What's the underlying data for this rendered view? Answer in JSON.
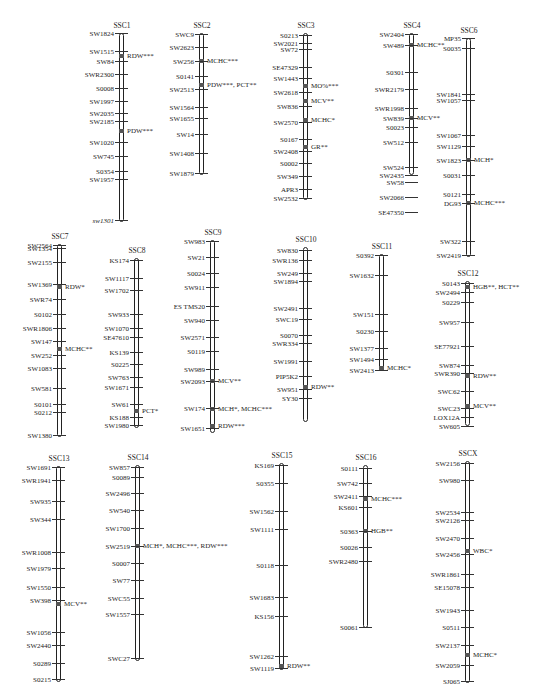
{
  "figure": {
    "chromosomes": [
      {
        "name": "SSC1",
        "x": 120,
        "top": 33,
        "bottom": 221,
        "markers": [
          {
            "label": "SW1824",
            "y": 33
          },
          {
            "label": "SW1515",
            "y": 51
          },
          {
            "label": "SW84",
            "y": 61
          },
          {
            "label": "SWR2300",
            "y": 74
          },
          {
            "label": "S0008",
            "y": 88
          },
          {
            "label": "SW1997",
            "y": 101
          },
          {
            "label": "SW2035",
            "y": 113
          },
          {
            "label": "SW2185",
            "y": 121
          },
          {
            "label": "SW1020",
            "y": 142
          },
          {
            "label": "SW745",
            "y": 156
          },
          {
            "label": "S0354",
            "y": 171
          },
          {
            "label": "SW1957",
            "y": 179
          },
          {
            "label": "sw1301",
            "y": 220
          }
        ],
        "qtls": [
          {
            "label": "RDW***",
            "y": 56
          },
          {
            "label": "PDW***",
            "y": 131
          }
        ]
      },
      {
        "name": "SSC2",
        "x": 200,
        "top": 33,
        "bottom": 174,
        "markers": [
          {
            "label": "SWC9",
            "y": 34
          },
          {
            "label": "SW2623",
            "y": 47
          },
          {
            "label": "SW256",
            "y": 61
          },
          {
            "label": "S0141",
            "y": 76
          },
          {
            "label": "SW2513",
            "y": 89
          },
          {
            "label": "SW1564",
            "y": 107
          },
          {
            "label": "SW1655",
            "y": 118
          },
          {
            "label": "SW14",
            "y": 134
          },
          {
            "label": "SW1408",
            "y": 153
          },
          {
            "label": "SW1879",
            "y": 173
          }
        ],
        "qtls": [
          {
            "label": "MCHC***",
            "y": 61
          },
          {
            "label": "PDW***, PCT**",
            "y": 85
          }
        ]
      },
      {
        "name": "SSC3",
        "x": 304,
        "top": 33,
        "bottom": 199,
        "markers": [
          {
            "label": "S0213",
            "y": 35
          },
          {
            "label": "SW2021",
            "y": 43
          },
          {
            "label": "SW72",
            "y": 49
          },
          {
            "label": "SE47329",
            "y": 67
          },
          {
            "label": "SW1443",
            "y": 78
          },
          {
            "label": "SW2618",
            "y": 92
          },
          {
            "label": "SW836",
            "y": 106
          },
          {
            "label": "SW2570",
            "y": 122
          },
          {
            "label": "S0167",
            "y": 139
          },
          {
            "label": "SW2408",
            "y": 151
          },
          {
            "label": "S0002",
            "y": 163
          },
          {
            "label": "SW349",
            "y": 176
          },
          {
            "label": "APR3",
            "y": 189
          },
          {
            "label": "SW2532",
            "y": 198
          }
        ],
        "qtls": [
          {
            "label": "MO%***",
            "y": 86
          },
          {
            "label": "MCV**",
            "y": 101
          },
          {
            "label": "MCHC*",
            "y": 120
          },
          {
            "label": "GR**",
            "y": 147
          }
        ]
      },
      {
        "name": "SSC4",
        "x": 410,
        "top": 33,
        "bottom": 174,
        "markers": [
          {
            "label": "SW2404",
            "y": 34
          },
          {
            "label": "SW489",
            "y": 45
          },
          {
            "label": "S0301",
            "y": 72
          },
          {
            "label": "SWR2179",
            "y": 89
          },
          {
            "label": "SWR1998",
            "y": 108
          },
          {
            "label": "SW839",
            "y": 118
          },
          {
            "label": "S0023",
            "y": 127
          },
          {
            "label": "SW512",
            "y": 142
          },
          {
            "label": "SW524",
            "y": 167
          },
          {
            "label": "SW2435",
            "y": 175
          },
          {
            "label": "SW58",
            "y": 182
          },
          {
            "label": "SW2066",
            "y": 197
          },
          {
            "label": "SE47350",
            "y": 212
          }
        ],
        "qtls": [
          {
            "label": "MCHC**",
            "y": 45
          },
          {
            "label": "MCV**",
            "y": 118
          }
        ]
      },
      {
        "name": "SSC6",
        "x": 467,
        "top": 38,
        "bottom": 256,
        "markers": [
          {
            "label": "MP35",
            "y": 38
          },
          {
            "label": "S0035",
            "y": 48
          },
          {
            "label": "SW1841",
            "y": 94
          },
          {
            "label": "SW1057",
            "y": 100
          },
          {
            "label": "SW1067",
            "y": 135
          },
          {
            "label": "SW1129",
            "y": 146
          },
          {
            "label": "SW1823",
            "y": 160
          },
          {
            "label": "S0031",
            "y": 175
          },
          {
            "label": "S0121",
            "y": 194
          },
          {
            "label": "DG93",
            "y": 203
          },
          {
            "label": "SW322",
            "y": 241
          },
          {
            "label": "SW2419",
            "y": 255
          }
        ],
        "qtls": [
          {
            "label": "MCH*",
            "y": 160
          },
          {
            "label": "MCHC***",
            "y": 203
          }
        ]
      },
      {
        "name": "SSC7",
        "x": 58,
        "top": 244,
        "bottom": 436,
        "markers": [
          {
            "label": "SW2564",
            "y": 245
          },
          {
            "label": "SW1354",
            "y": 248
          },
          {
            "label": "SW2155",
            "y": 262
          },
          {
            "label": "SW1369",
            "y": 284
          },
          {
            "label": "SWR74",
            "y": 299
          },
          {
            "label": "S0102",
            "y": 314
          },
          {
            "label": "SWR1806",
            "y": 328
          },
          {
            "label": "SW147",
            "y": 341
          },
          {
            "label": "SW252",
            "y": 355
          },
          {
            "label": "SW1083",
            "y": 368
          },
          {
            "label": "SW581",
            "y": 388
          },
          {
            "label": "S0101",
            "y": 404
          },
          {
            "label": "S0212",
            "y": 412
          },
          {
            "label": "SW1380",
            "y": 435
          }
        ],
        "qtls": [
          {
            "label": "RDW*",
            "y": 287
          },
          {
            "label": "MCHC**",
            "y": 349
          }
        ]
      },
      {
        "name": "SSC8",
        "x": 135,
        "top": 258,
        "bottom": 427,
        "markers": [
          {
            "label": "KS174",
            "y": 260
          },
          {
            "label": "SW1117",
            "y": 278
          },
          {
            "label": "SW1702",
            "y": 290
          },
          {
            "label": "SW933",
            "y": 314
          },
          {
            "label": "SW1070",
            "y": 328
          },
          {
            "label": "SE47610",
            "y": 337
          },
          {
            "label": "KS139",
            "y": 352
          },
          {
            "label": "S0225",
            "y": 364
          },
          {
            "label": "SW763",
            "y": 377
          },
          {
            "label": "SW1671",
            "y": 387
          },
          {
            "label": "SW61",
            "y": 404
          },
          {
            "label": "KS188",
            "y": 417
          },
          {
            "label": "SW1980",
            "y": 425
          }
        ],
        "qtls": [
          {
            "label": "PCT*",
            "y": 411
          }
        ]
      },
      {
        "name": "SSC9",
        "x": 211,
        "top": 240,
        "bottom": 432,
        "markers": [
          {
            "label": "SW983",
            "y": 241
          },
          {
            "label": "SW21",
            "y": 257
          },
          {
            "label": "S0024",
            "y": 273
          },
          {
            "label": "SW911",
            "y": 287
          },
          {
            "label": "ES TMS20",
            "y": 306
          },
          {
            "label": "SW940",
            "y": 320
          },
          {
            "label": "SW2571",
            "y": 337
          },
          {
            "label": "S0119",
            "y": 351
          },
          {
            "label": "SW989",
            "y": 369
          },
          {
            "label": "SW2093",
            "y": 381
          },
          {
            "label": "SW174",
            "y": 408
          },
          {
            "label": "SW1651",
            "y": 428
          }
        ],
        "qtls": [
          {
            "label": "MCV**",
            "y": 381
          },
          {
            "label": "MCH*, MCHC***",
            "y": 409
          },
          {
            "label": "RDW***",
            "y": 426
          }
        ]
      },
      {
        "name": "SSC10",
        "x": 304,
        "top": 247,
        "bottom": 421,
        "markers": [
          {
            "label": "SW830",
            "y": 250
          },
          {
            "label": "SWR136",
            "y": 260
          },
          {
            "label": "SW249",
            "y": 273
          },
          {
            "label": "SW1894",
            "y": 281
          },
          {
            "label": "SW2491",
            "y": 308
          },
          {
            "label": "SWC19",
            "y": 319
          },
          {
            "label": "S0070",
            "y": 335
          },
          {
            "label": "SWR334",
            "y": 343
          },
          {
            "label": "SW1991",
            "y": 361
          },
          {
            "label": "PIP5K2",
            "y": 376
          },
          {
            "label": "SW951",
            "y": 389
          },
          {
            "label": "SY30",
            "y": 398
          }
        ],
        "qtls": [
          {
            "label": "RDW**",
            "y": 387
          }
        ]
      },
      {
        "name": "SSC11",
        "x": 380,
        "top": 254,
        "bottom": 369,
        "markers": [
          {
            "label": "S0392",
            "y": 255
          },
          {
            "label": "SW1632",
            "y": 275
          },
          {
            "label": "SW151",
            "y": 314
          },
          {
            "label": "S0230",
            "y": 331
          },
          {
            "label": "SW1377",
            "y": 348
          },
          {
            "label": "SW1494",
            "y": 359
          },
          {
            "label": "SW2413",
            "y": 370
          }
        ],
        "qtls": [
          {
            "label": "MCHC*",
            "y": 368
          }
        ]
      },
      {
        "name": "SSC12",
        "x": 466,
        "top": 281,
        "bottom": 425,
        "markers": [
          {
            "label": "S0143",
            "y": 283
          },
          {
            "label": "SW2494",
            "y": 292
          },
          {
            "label": "S0229",
            "y": 302
          },
          {
            "label": "SW957",
            "y": 322
          },
          {
            "label": "SE77921",
            "y": 346
          },
          {
            "label": "SW874",
            "y": 365
          },
          {
            "label": "SWR390",
            "y": 373
          },
          {
            "label": "SWC62",
            "y": 391
          },
          {
            "label": "SWC23",
            "y": 408
          },
          {
            "label": "LOX12A",
            "y": 417
          },
          {
            "label": "SW605",
            "y": 426
          }
        ],
        "qtls": [
          {
            "label": "HGB**, HCT**",
            "y": 287
          },
          {
            "label": "RDW**",
            "y": 376
          },
          {
            "label": "MCV**",
            "y": 406
          }
        ]
      },
      {
        "name": "SSC13",
        "x": 57,
        "top": 466,
        "bottom": 681,
        "markers": [
          {
            "label": "SW1691",
            "y": 467
          },
          {
            "label": "SWR1941",
            "y": 480
          },
          {
            "label": "SW935",
            "y": 501
          },
          {
            "label": "SW344",
            "y": 519
          },
          {
            "label": "SWR1008",
            "y": 552
          },
          {
            "label": "SW1979",
            "y": 568
          },
          {
            "label": "SW1550",
            "y": 587
          },
          {
            "label": "SW398",
            "y": 600
          },
          {
            "label": "SW1056",
            "y": 632
          },
          {
            "label": "SW2440",
            "y": 645
          },
          {
            "label": "S0289",
            "y": 663
          },
          {
            "label": "S0215",
            "y": 679
          }
        ],
        "qtls": [
          {
            "label": "MCV**",
            "y": 604
          }
        ]
      },
      {
        "name": "SSC14",
        "x": 136,
        "top": 465,
        "bottom": 660,
        "markers": [
          {
            "label": "SW857",
            "y": 467
          },
          {
            "label": "S0089",
            "y": 477
          },
          {
            "label": "SW2496",
            "y": 493
          },
          {
            "label": "SW540",
            "y": 510
          },
          {
            "label": "SW1700",
            "y": 528
          },
          {
            "label": "SW2519",
            "y": 546
          },
          {
            "label": "S0007",
            "y": 563
          },
          {
            "label": "SW77",
            "y": 580
          },
          {
            "label": "SWC55",
            "y": 598
          },
          {
            "label": "SW1557",
            "y": 614
          },
          {
            "label": "SWC27",
            "y": 658
          }
        ],
        "qtls": [
          {
            "label": "MCH*, MCHC***, RDW***",
            "y": 546
          }
        ]
      },
      {
        "name": "SSC15",
        "x": 280,
        "top": 463,
        "bottom": 669,
        "markers": [
          {
            "label": "KS169",
            "y": 465
          },
          {
            "label": "S0355",
            "y": 483
          },
          {
            "label": "SW1562",
            "y": 511
          },
          {
            "label": "SW1111",
            "y": 529
          },
          {
            "label": "S0118",
            "y": 565
          },
          {
            "label": "SW1683",
            "y": 597
          },
          {
            "label": "KS156",
            "y": 616
          },
          {
            "label": "SW1262",
            "y": 656
          },
          {
            "label": "SW1119",
            "y": 668
          }
        ],
        "qtls": [
          {
            "label": "RDW**",
            "y": 666
          }
        ]
      },
      {
        "name": "SSC16",
        "x": 364,
        "top": 465,
        "bottom": 627,
        "markers": [
          {
            "label": "S0111",
            "y": 468
          },
          {
            "label": "SW742",
            "y": 483
          },
          {
            "label": "SW2411",
            "y": 496
          },
          {
            "label": "KS601",
            "y": 507
          },
          {
            "label": "S0363",
            "y": 531
          },
          {
            "label": "S0026",
            "y": 547
          },
          {
            "label": "SWR2480",
            "y": 561
          },
          {
            "label": "S0061",
            "y": 627
          }
        ],
        "qtls": [
          {
            "label": "MCHC***",
            "y": 499
          },
          {
            "label": "HGB**",
            "y": 531
          }
        ]
      },
      {
        "name": "SSCX",
        "x": 466,
        "top": 461,
        "bottom": 682,
        "markers": [
          {
            "label": "SW2156",
            "y": 463
          },
          {
            "label": "SW980",
            "y": 480
          },
          {
            "label": "SW2534",
            "y": 512
          },
          {
            "label": "SW2126",
            "y": 520
          },
          {
            "label": "SW2470",
            "y": 538
          },
          {
            "label": "SW2456",
            "y": 554
          },
          {
            "label": "SWR1861",
            "y": 574
          },
          {
            "label": "SE15078",
            "y": 587
          },
          {
            "label": "SW1943",
            "y": 610
          },
          {
            "label": "S0511",
            "y": 627
          },
          {
            "label": "SW2137",
            "y": 645
          },
          {
            "label": "SW2059",
            "y": 665
          },
          {
            "label": "SJ065",
            "y": 681
          }
        ],
        "qtls": [
          {
            "label": "WBC*",
            "y": 551
          },
          {
            "label": "MCHC*",
            "y": 655
          }
        ]
      }
    ]
  }
}
